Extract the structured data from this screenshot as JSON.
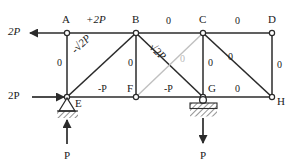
{
  "diagram": {
    "colors": {
      "member": "#2b2b2b",
      "zero_member": "#c0c0c0",
      "text": "#1a1a1a",
      "faint_text": "#b9b9b9",
      "node_fill": "#ffffff"
    },
    "nodes": [
      {
        "id": "A",
        "label": "A",
        "x": 67,
        "y": 33
      },
      {
        "id": "B",
        "label": "B",
        "x": 136,
        "y": 33
      },
      {
        "id": "C",
        "label": "C",
        "x": 203,
        "y": 33
      },
      {
        "id": "D",
        "label": "D",
        "x": 272,
        "y": 33
      },
      {
        "id": "E",
        "label": "E",
        "x": 67,
        "y": 97
      },
      {
        "id": "F",
        "label": "F",
        "x": 136,
        "y": 97
      },
      {
        "id": "G",
        "label": "G",
        "x": 203,
        "y": 97
      },
      {
        "id": "H",
        "label": "H",
        "x": 272,
        "y": 97
      }
    ],
    "members": [
      {
        "id": "AB",
        "from": "A",
        "to": "B",
        "force": "+2P",
        "kind": "top-chord"
      },
      {
        "id": "BC",
        "from": "B",
        "to": "C",
        "force": "0",
        "kind": "top-chord"
      },
      {
        "id": "CD",
        "from": "C",
        "to": "D",
        "force": "0",
        "kind": "top-chord"
      },
      {
        "id": "EF",
        "from": "E",
        "to": "F",
        "force": "-P",
        "kind": "bottom-chord"
      },
      {
        "id": "FG",
        "from": "F",
        "to": "G",
        "force": "-P",
        "kind": "bottom-chord"
      },
      {
        "id": "GH",
        "from": "G",
        "to": "H",
        "force": "0",
        "kind": "bottom-chord"
      },
      {
        "id": "AE",
        "from": "A",
        "to": "E",
        "force": "0",
        "kind": "vertical"
      },
      {
        "id": "BF",
        "from": "B",
        "to": "F",
        "force": "0",
        "kind": "vertical"
      },
      {
        "id": "CG",
        "from": "C",
        "to": "G",
        "force": "0",
        "kind": "vertical"
      },
      {
        "id": "DH",
        "from": "D",
        "to": "H",
        "force": "0",
        "kind": "vertical"
      },
      {
        "id": "EB",
        "from": "E",
        "to": "B",
        "force": "-√2P",
        "kind": "diagonal"
      },
      {
        "id": "BG",
        "from": "B",
        "to": "G",
        "force": "√2P",
        "kind": "diagonal"
      },
      {
        "id": "FC",
        "from": "F",
        "to": "C",
        "force": "0",
        "kind": "diagonal-zero"
      },
      {
        "id": "CH",
        "from": "C",
        "to": "H",
        "force": "0",
        "kind": "diagonal"
      }
    ],
    "loads": [
      {
        "id": "load-A",
        "label": "2P",
        "at": "A",
        "direction": "left",
        "italic": true
      },
      {
        "id": "load-E",
        "label": "2P",
        "at": "E",
        "direction": "right",
        "italic": false
      },
      {
        "id": "reaction-E",
        "label": "P",
        "at": "E",
        "direction": "up",
        "italic": false
      },
      {
        "id": "load-G",
        "label": "P",
        "at": "G",
        "direction": "down",
        "italic": false
      }
    ],
    "supports": [
      {
        "id": "support-E",
        "at": "E",
        "type": "pin"
      },
      {
        "id": "support-G",
        "at": "G",
        "type": "roller"
      }
    ],
    "member_label_positions": [
      {
        "id": "AB",
        "text": "+2P",
        "x": 86,
        "y": 14,
        "italic": true,
        "rotate": "none",
        "gray": false
      },
      {
        "id": "BC",
        "text": "0",
        "x": 166,
        "y": 16,
        "italic": false,
        "rotate": "none",
        "gray": false
      },
      {
        "id": "CD",
        "text": "0",
        "x": 235,
        "y": 16,
        "italic": false,
        "rotate": "none",
        "gray": false
      },
      {
        "id": "AE",
        "text": "0",
        "x": 57,
        "y": 58,
        "italic": false,
        "rotate": "none",
        "gray": false
      },
      {
        "id": "BF",
        "text": "0",
        "x": 128,
        "y": 58,
        "italic": false,
        "rotate": "none",
        "gray": false
      },
      {
        "id": "CG",
        "text": "0",
        "x": 208,
        "y": 58,
        "italic": false,
        "rotate": "none",
        "gray": false
      },
      {
        "id": "DH",
        "text": "0",
        "x": 277,
        "y": 60,
        "italic": false,
        "rotate": "none",
        "gray": false
      },
      {
        "id": "EB",
        "text": "-√2P",
        "x": 82,
        "y": 48,
        "italic": true,
        "rotate": "left",
        "gray": false
      },
      {
        "id": "BG",
        "text": "√2P",
        "x": 155,
        "y": 38,
        "italic": true,
        "rotate": "right",
        "gray": false
      },
      {
        "id": "FC",
        "text": "0",
        "x": 180,
        "y": 54,
        "italic": false,
        "rotate": "none",
        "gray": true
      },
      {
        "id": "CH",
        "text": "0",
        "x": 228,
        "y": 52,
        "italic": false,
        "rotate": "none",
        "gray": false
      },
      {
        "id": "EF",
        "text": "-P",
        "x": 98,
        "y": 84,
        "italic": false,
        "rotate": "none",
        "gray": false
      },
      {
        "id": "FG",
        "text": "-P",
        "x": 164,
        "y": 84,
        "italic": false,
        "rotate": "none",
        "gray": false
      },
      {
        "id": "GH",
        "text": "0",
        "x": 235,
        "y": 84,
        "italic": false,
        "rotate": "none",
        "gray": false
      }
    ],
    "node_label_positions": [
      {
        "id": "A",
        "text": "A",
        "x": 62,
        "y": 14
      },
      {
        "id": "B",
        "text": "B",
        "x": 132,
        "y": 14
      },
      {
        "id": "C",
        "text": "C",
        "x": 199,
        "y": 14
      },
      {
        "id": "D",
        "text": "D",
        "x": 268,
        "y": 14
      },
      {
        "id": "E",
        "text": "E",
        "x": 75,
        "y": 98
      },
      {
        "id": "F",
        "text": "F",
        "x": 127,
        "y": 83
      },
      {
        "id": "G",
        "text": "G",
        "x": 208,
        "y": 83
      },
      {
        "id": "H",
        "text": "H",
        "x": 277,
        "y": 96
      }
    ],
    "load_label_positions": [
      {
        "id": "load-A",
        "text": "2P",
        "x": 8,
        "y": 26,
        "italic": true
      },
      {
        "id": "load-E",
        "text": "2P",
        "x": 8,
        "y": 90,
        "italic": false
      },
      {
        "id": "reaction-E",
        "text": "P",
        "x": 64,
        "y": 150,
        "italic": false
      },
      {
        "id": "load-G",
        "text": "P",
        "x": 200,
        "y": 150,
        "italic": false
      }
    ]
  }
}
